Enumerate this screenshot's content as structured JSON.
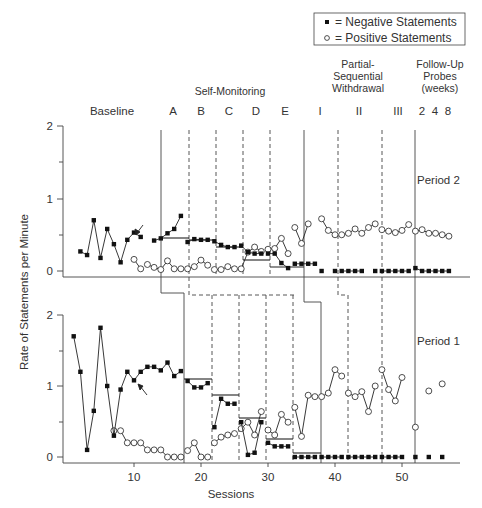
{
  "legend": {
    "negative_label": "= Negative Statements",
    "positive_label": "= Positive Statements"
  },
  "phases": {
    "baseline": "Baseline",
    "self_monitoring": "Self-Monitoring",
    "self_monitoring_subphases": [
      "A",
      "B",
      "C",
      "D",
      "E"
    ],
    "withdrawal_title_1": "Partial-",
    "withdrawal_title_2": "Sequential",
    "withdrawal_title_3": "Withdrawal",
    "withdrawal_subphases": [
      "I",
      "II",
      "III"
    ],
    "followup_title_1": "Follow-Up",
    "followup_title_2": "Probes",
    "followup_title_3": "(weeks)",
    "followup_weeks": [
      "2",
      "4",
      "8"
    ]
  },
  "panels": {
    "top": "Period 2",
    "bottom": "Period 1"
  },
  "axes": {
    "ylabel": "Rate of Statements per Minute",
    "xlabel": "Sessions",
    "y_ticks": [
      "0",
      "1",
      "2"
    ],
    "x_ticks": [
      "10",
      "20",
      "30",
      "40",
      "50"
    ]
  },
  "chart_data": {
    "type": "line",
    "title": "",
    "xlabel": "Sessions",
    "ylabel": "Rate of Statements per Minute",
    "xlim": [
      0,
      57
    ],
    "ylim": [
      0,
      2
    ],
    "grid": false,
    "legend_position": "top-right",
    "panels": [
      {
        "name": "Period 2",
        "series": [
          {
            "name": "Negative Statements",
            "marker": "filled-square",
            "points": [
              [
                2,
                0.27
              ],
              [
                3,
                0.22
              ],
              [
                4,
                0.7
              ],
              [
                5,
                0.18
              ],
              [
                6,
                0.58
              ],
              [
                7,
                0.37
              ],
              [
                8,
                0.12
              ],
              [
                9,
                0.43
              ],
              [
                10,
                0.53
              ],
              [
                11,
                0.47
              ],
              [
                13,
                0.42
              ],
              [
                14,
                0.45
              ],
              [
                15,
                0.52
              ],
              [
                16,
                0.58
              ],
              [
                17,
                0.76
              ],
              [
                18,
                0.4
              ],
              [
                19,
                0.44
              ],
              [
                20,
                0.43
              ],
              [
                21,
                0.43
              ],
              [
                22,
                0.41
              ],
              [
                23,
                0.36
              ],
              [
                24,
                0.33
              ],
              [
                25,
                0.33
              ],
              [
                26,
                0.35
              ],
              [
                27,
                0.26
              ],
              [
                28,
                0.24
              ],
              [
                29,
                0.24
              ],
              [
                30,
                0.24
              ],
              [
                31,
                0.24
              ],
              [
                32,
                0.11
              ],
              [
                33,
                0.04
              ],
              [
                34,
                0.1
              ],
              [
                35,
                0.1
              ],
              [
                36,
                0.1
              ],
              [
                37,
                0.1
              ],
              [
                38,
                0.0
              ],
              [
                40,
                0.0
              ],
              [
                41,
                0.0
              ],
              [
                42,
                0.0
              ],
              [
                43,
                0.0
              ],
              [
                44,
                0.0
              ],
              [
                46,
                0.0
              ],
              [
                47,
                0.0
              ],
              [
                48,
                0.0
              ],
              [
                49,
                0.0
              ],
              [
                50,
                0.0
              ],
              [
                51,
                0.0
              ],
              [
                52,
                0.04
              ],
              [
                53,
                0.0
              ],
              [
                54,
                0.0
              ],
              [
                55,
                0.0
              ],
              [
                56,
                0.0
              ],
              [
                57,
                0.0
              ]
            ],
            "segments_note": "Sessions connected within phases; gap after session 11 (arrow)."
          },
          {
            "name": "Positive Statements",
            "marker": "open-circle",
            "points": [
              [
                10,
                0.16
              ],
              [
                11,
                0.03
              ],
              [
                12,
                0.09
              ],
              [
                13,
                0.05
              ],
              [
                14,
                0.02
              ],
              [
                15,
                0.14
              ],
              [
                16,
                0.03
              ],
              [
                17,
                0.03
              ],
              [
                18,
                0.03
              ],
              [
                19,
                0.06
              ],
              [
                20,
                0.15
              ],
              [
                21,
                0.08
              ],
              [
                22,
                0.02
              ],
              [
                23,
                0.02
              ],
              [
                24,
                0.06
              ],
              [
                25,
                0.03
              ],
              [
                26,
                0.03
              ],
              [
                27,
                0.26
              ],
              [
                28,
                0.33
              ],
              [
                29,
                0.27
              ],
              [
                30,
                0.3
              ],
              [
                31,
                0.31
              ],
              [
                32,
                0.45
              ],
              [
                33,
                0.24
              ],
              [
                34,
                0.25
              ],
              [
                35,
                0.22
              ],
              [
                36,
                0.4
              ],
              [
                37,
                0.35
              ],
              [
                38,
                0.25
              ]
            ],
            "note": "Self-monitoring phase partially overlaps negative data; later points listed below"
          }
        ],
        "phase_mean_lines": [
          {
            "phase": "A",
            "from": 18,
            "to": 22,
            "value": 0.46
          },
          {
            "phase": "B",
            "from": 22,
            "to": 26,
            "value": 0.43
          },
          {
            "phase": "C",
            "from": 26,
            "to": 30,
            "value": 0.33
          },
          {
            "phase": "D",
            "from": 30,
            "to": 34,
            "value": 0.16
          },
          {
            "phase": "E",
            "from": 34,
            "to": 38,
            "value": 0.05
          }
        ]
      },
      {
        "name": "Period 1",
        "series": [
          {
            "name": "Negative Statements",
            "marker": "filled-square",
            "points": [
              [
                1,
                1.7
              ],
              [
                2,
                1.2
              ],
              [
                3,
                0.1
              ],
              [
                4,
                0.65
              ],
              [
                5,
                1.82
              ],
              [
                6,
                1.0
              ],
              [
                7,
                0.3
              ],
              [
                8,
                0.95
              ],
              [
                9,
                1.2
              ],
              [
                10,
                1.08
              ],
              [
                11,
                1.2
              ],
              [
                12,
                1.27
              ],
              [
                13,
                1.27
              ],
              [
                14,
                1.22
              ],
              [
                15,
                1.33
              ],
              [
                16,
                1.14
              ],
              [
                17,
                1.21
              ],
              [
                18,
                1.07
              ],
              [
                19,
                0.98
              ],
              [
                20,
                0.98
              ],
              [
                21,
                1.04
              ],
              [
                22,
                0.42
              ],
              [
                23,
                0.82
              ],
              [
                24,
                0.75
              ],
              [
                25,
                0.75
              ],
              [
                26,
                0.49
              ],
              [
                27,
                0.03
              ],
              [
                28,
                0.06
              ],
              [
                29,
                0.49
              ],
              [
                30,
                0.2
              ],
              [
                31,
                0.15
              ],
              [
                32,
                0.15
              ],
              [
                33,
                0.15
              ],
              [
                34,
                0.0
              ],
              [
                35,
                0.0
              ],
              [
                36,
                0.0
              ],
              [
                37,
                0.0
              ],
              [
                38,
                0.0
              ],
              [
                39,
                0.0
              ],
              [
                40,
                0.0
              ],
              [
                41,
                0.0
              ],
              [
                42,
                0.0
              ],
              [
                43,
                0.0
              ],
              [
                44,
                0.0
              ],
              [
                45,
                0.0
              ],
              [
                46,
                0.0
              ],
              [
                47,
                0.0
              ],
              [
                48,
                0.0
              ],
              [
                49,
                0.0
              ],
              [
                50,
                0.0
              ],
              [
                52,
                0.0
              ],
              [
                54,
                0.0
              ],
              [
                56,
                0.0
              ]
            ]
          },
          {
            "name": "Positive Statements",
            "marker": "open-circle",
            "points": [
              [
                7,
                0.37
              ],
              [
                8,
                0.37
              ],
              [
                9,
                0.2
              ],
              [
                10,
                0.2
              ],
              [
                11,
                0.2
              ],
              [
                12,
                0.1
              ],
              [
                13,
                0.1
              ],
              [
                14,
                0.1
              ],
              [
                15,
                0.0
              ],
              [
                16,
                0.0
              ],
              [
                17,
                0.0
              ],
              [
                18,
                0.09
              ],
              [
                19,
                0.2
              ],
              [
                20,
                0.0
              ],
              [
                21,
                0.0
              ],
              [
                22,
                0.2
              ],
              [
                23,
                0.28
              ],
              [
                24,
                0.31
              ],
              [
                25,
                0.33
              ],
              [
                26,
                0.4
              ],
              [
                27,
                0.49
              ],
              [
                28,
                0.31
              ],
              [
                29,
                0.64
              ],
              [
                30,
                0.38
              ],
              [
                31,
                0.31
              ],
              [
                32,
                0.6
              ],
              [
                33,
                0.49
              ],
              [
                34,
                0.7
              ],
              [
                35,
                0.29
              ],
              [
                36,
                0.87
              ],
              [
                37,
                0.85
              ],
              [
                38,
                0.85
              ],
              [
                39,
                0.9
              ],
              [
                40,
                1.23
              ],
              [
                41,
                1.14
              ],
              [
                42,
                0.9
              ],
              [
                43,
                0.85
              ],
              [
                44,
                0.92
              ],
              [
                45,
                0.64
              ],
              [
                46,
                1.0
              ],
              [
                47,
                1.23
              ],
              [
                48,
                0.95
              ],
              [
                49,
                0.79
              ],
              [
                50,
                1.12
              ],
              [
                52,
                0.42
              ],
              [
                54,
                0.93
              ],
              [
                56,
                1.03
              ]
            ]
          }
        ],
        "phase_mean_lines": [
          {
            "phase": "A",
            "from": 18,
            "to": 22,
            "value": 1.1
          },
          {
            "phase": "B",
            "from": 22,
            "to": 26,
            "value": 0.87
          },
          {
            "phase": "C",
            "from": 26,
            "to": 30,
            "value": 0.55
          },
          {
            "phase": "D",
            "from": 30,
            "to": 34,
            "value": 0.25
          },
          {
            "phase": "E",
            "from": 34,
            "to": 38,
            "value": 0.05
          }
        ]
      }
    ],
    "period2_positive_later": [
      [
        34,
        0.6
      ],
      [
        35,
        0.38
      ],
      [
        36,
        0.65
      ],
      [
        38,
        0.72
      ],
      [
        39,
        0.56
      ],
      [
        40,
        0.5
      ],
      [
        41,
        0.5
      ],
      [
        42,
        0.52
      ],
      [
        43,
        0.58
      ],
      [
        44,
        0.52
      ],
      [
        45,
        0.6
      ],
      [
        46,
        0.65
      ],
      [
        47,
        0.57
      ],
      [
        48,
        0.55
      ],
      [
        49,
        0.53
      ],
      [
        50,
        0.56
      ],
      [
        51,
        0.64
      ],
      [
        52,
        0.55
      ],
      [
        53,
        0.57
      ],
      [
        54,
        0.52
      ],
      [
        55,
        0.52
      ],
      [
        56,
        0.5
      ],
      [
        57,
        0.48
      ]
    ]
  }
}
